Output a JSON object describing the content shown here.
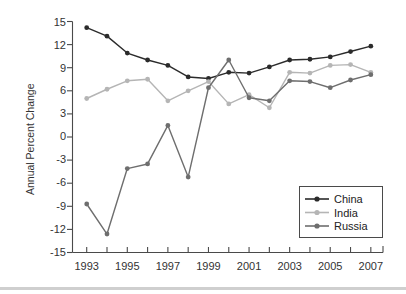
{
  "chart_data": {
    "type": "line",
    "title": "",
    "subtitle": "",
    "xlabel": "",
    "ylabel": "Annual Percent Change",
    "x": [
      1993,
      1994,
      1995,
      1996,
      1997,
      1998,
      1999,
      2000,
      2001,
      2002,
      2003,
      2004,
      2005,
      2006,
      2007
    ],
    "categories": [
      "1993",
      "1994",
      "1995",
      "1996",
      "1997",
      "1998",
      "1999",
      "2000",
      "2001",
      "2002",
      "2003",
      "2004",
      "2005",
      "2006",
      "2007"
    ],
    "xtick_labels": [
      "1993",
      "1995",
      "1997",
      "1999",
      "2001",
      "2003",
      "2005",
      "2007"
    ],
    "xlim": [
      1992.3,
      2007.6
    ],
    "ylim": [
      -15,
      15
    ],
    "ytick_labels": [
      "15",
      "12",
      "9",
      "6",
      "3",
      "0",
      "-3",
      "-6",
      "-9",
      "-12",
      "-15"
    ],
    "yticks": [
      15,
      12,
      9,
      6,
      3,
      0,
      -3,
      -6,
      -9,
      -12,
      -15
    ],
    "grid": false,
    "legend_position": "bottom-right",
    "series": [
      {
        "name": "China",
        "color": "#2b2b2b",
        "values": [
          14.2,
          13.1,
          10.9,
          10.0,
          9.3,
          7.8,
          7.6,
          8.4,
          8.3,
          9.1,
          10.0,
          10.1,
          10.4,
          11.1,
          11.8
        ]
      },
      {
        "name": "India",
        "color": "#b5b5b5",
        "values": [
          5.0,
          6.2,
          7.3,
          7.5,
          4.7,
          6.0,
          7.2,
          4.3,
          5.5,
          3.8,
          8.4,
          8.3,
          9.3,
          9.4,
          8.4
        ]
      },
      {
        "name": "Russia",
        "color": "#6e6e6e",
        "values": [
          -8.7,
          -12.6,
          -4.1,
          -3.5,
          1.5,
          -5.2,
          6.4,
          10.0,
          5.1,
          4.7,
          7.3,
          7.2,
          6.4,
          7.4,
          8.1
        ]
      }
    ]
  },
  "legend": {
    "entries": [
      {
        "label": "China"
      },
      {
        "label": "India"
      },
      {
        "label": "Russia"
      }
    ]
  },
  "axes": {
    "y_axis_title": "Annual Percent Change"
  }
}
